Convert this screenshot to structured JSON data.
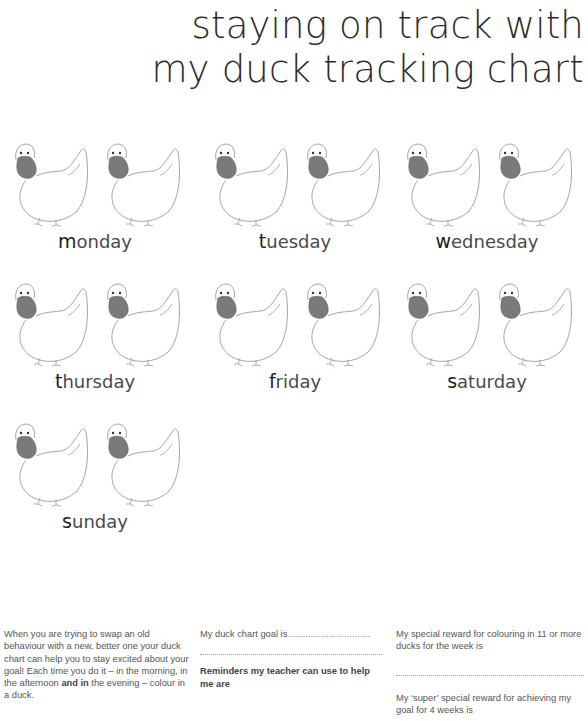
{
  "title": {
    "line1": "staying on track with",
    "line2": "my duck tracking chart"
  },
  "duck_icon": "duck-icon",
  "days": [
    {
      "first": "m",
      "rest": "onday",
      "ducks": 2
    },
    {
      "first": "t",
      "rest": "uesday",
      "ducks": 2
    },
    {
      "first": "w",
      "rest": "ednesday",
      "ducks": 2
    },
    {
      "first": "t",
      "rest": "hursday",
      "ducks": 2
    },
    {
      "first": "f",
      "rest": "riday",
      "ducks": 2
    },
    {
      "first": "s",
      "rest": "aturday",
      "ducks": 2
    },
    {
      "first": "s",
      "rest": "unday",
      "ducks": 2
    }
  ],
  "colors": {
    "beak": "#7a7a7a",
    "outline": "#9a9a9a",
    "text": "#333333"
  },
  "footer": {
    "intro": {
      "part1": "When you are trying to swap an old behaviour with a new, better one your duck chart can help you to stay excited about your goal! Each time you do it – in the morning, in the afternoon ",
      "bold": "and in",
      "part2": " the evening – colour in a duck."
    },
    "goal": {
      "label": "My duck chart goal is",
      "dots": "................................"
    },
    "reminders": {
      "label": "Reminders my teacher can use to help me are"
    },
    "reward": {
      "label": "My special reward for colouring in 11 or more ducks for the week is"
    },
    "super_reward": {
      "label": "My ‘super’ special reward for achieving my goal for 4 weeks is"
    }
  }
}
